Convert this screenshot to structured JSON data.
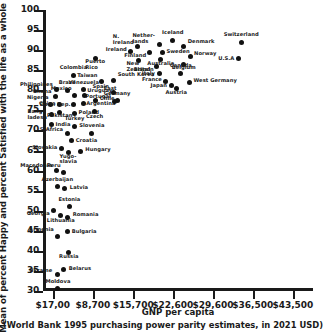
{
  "chart_data": {
    "type": "scatter",
    "title": "",
    "xlabel": "GNP per capita",
    "xlabel_note": "(World Bank 1995 purchasing power parity estimates, in 2021 USD)",
    "ylabel": "Mean of percent Happy and percent Satisfied with the life as a whole",
    "xlim": [
      0,
      47000
    ],
    "ylim": [
      30,
      100
    ],
    "grid": false,
    "legend": "none",
    "xticks": [
      {
        "value": 1700,
        "label": "$17,00"
      },
      {
        "value": 8700,
        "label": "$8,700"
      },
      {
        "value": 15700,
        "label": "$15,700"
      },
      {
        "value": 22600,
        "label": "$22,600"
      },
      {
        "value": 29600,
        "label": "$29,600"
      },
      {
        "value": 36500,
        "label": "$36,500"
      },
      {
        "value": 43500,
        "label": "$43,500"
      }
    ],
    "yticks": [
      {
        "value": 30,
        "label": "30"
      },
      {
        "value": 35,
        "label": "35"
      },
      {
        "value": 40,
        "label": "40"
      },
      {
        "value": 45,
        "label": "45"
      },
      {
        "value": 50,
        "label": "50"
      },
      {
        "value": 55,
        "label": "55"
      },
      {
        "value": 60,
        "label": "60"
      },
      {
        "value": 65,
        "label": "65"
      },
      {
        "value": 70,
        "label": "70"
      },
      {
        "value": 75,
        "label": "75"
      },
      {
        "value": 80,
        "label": "80"
      },
      {
        "value": 85,
        "label": "85"
      },
      {
        "value": 90,
        "label": "90"
      },
      {
        "value": 95,
        "label": "95"
      },
      {
        "value": 100,
        "label": "100"
      }
    ],
    "points": [
      {
        "label": "Moldova",
        "x": 2600,
        "y": 30.6,
        "lx": 0,
        "ly": -7,
        "align": "c"
      },
      {
        "label": "Ukraine",
        "x": 2500,
        "y": 34.0,
        "lx": -5,
        "ly": -4,
        "align": "r"
      },
      {
        "label": "Belarus",
        "x": 3600,
        "y": 35.3,
        "lx": 5,
        "ly": -1,
        "align": "l"
      },
      {
        "label": "Russia",
        "x": 4500,
        "y": 39.7,
        "lx": 0,
        "ly": 5,
        "align": "c"
      },
      {
        "label": "Armenia",
        "x": 2600,
        "y": 43.6,
        "lx": -4,
        "ly": -6,
        "align": "r"
      },
      {
        "label": "Bulgaria",
        "x": 4300,
        "y": 44.7,
        "lx": 4,
        "ly": 0,
        "align": "l"
      },
      {
        "label": "Georgia",
        "x": 1900,
        "y": 50.0,
        "lx": -4,
        "ly": 3,
        "align": "r"
      },
      {
        "label": "Lithuania",
        "x": 3100,
        "y": 48.7,
        "lx": 0,
        "ly": 5,
        "align": "c"
      },
      {
        "label": "Romania",
        "x": 4300,
        "y": 48.4,
        "lx": 5,
        "ly": -2,
        "align": "l"
      },
      {
        "label": "Estonia",
        "x": 4600,
        "y": 51.0,
        "lx": 0,
        "ly": -7,
        "align": "c"
      },
      {
        "label": "Azerbaijan",
        "x": 2500,
        "y": 56.0,
        "lx": 0,
        "ly": -7,
        "align": "c"
      },
      {
        "label": "Latvia",
        "x": 3800,
        "y": 55.5,
        "lx": 5,
        "ly": -1,
        "align": "l"
      },
      {
        "label": "Macedonia",
        "x": 2300,
        "y": 60.0,
        "lx": -4,
        "ly": -5,
        "align": "r"
      },
      {
        "label": "Peru",
        "x": 3600,
        "y": 59.6,
        "lx": -3,
        "ly": -6,
        "align": "r"
      },
      {
        "label": "Slovakia",
        "x": 3200,
        "y": 65.6,
        "lx": -4,
        "ly": 0,
        "align": "r"
      },
      {
        "label": "Yugo-\nslavia",
        "x": 4400,
        "y": 64.5,
        "lx": 0,
        "ly": 4,
        "align": "c"
      },
      {
        "label": "Hungary",
        "x": 6500,
        "y": 64.8,
        "lx": 5,
        "ly": -1,
        "align": "l"
      },
      {
        "label": "Croatia",
        "x": 5000,
        "y": 67.5,
        "lx": 4,
        "ly": 1,
        "align": "l"
      },
      {
        "label": "S-Africa",
        "x": 4200,
        "y": 69.2,
        "lx": -4,
        "ly": -4,
        "align": "r"
      },
      {
        "label": "Slovenia",
        "x": 8500,
        "y": 69.3,
        "lx": 0,
        "ly": -7,
        "align": "c"
      },
      {
        "label": "Turkey",
        "x": 5500,
        "y": 71.0,
        "lx": 0,
        "ly": -7,
        "align": "c"
      },
      {
        "label": "India",
        "x": 1500,
        "y": 71.6,
        "lx": 4,
        "ly": 1,
        "align": "l"
      },
      {
        "label": "Bang-\nladesh",
        "x": 1400,
        "y": 74.0,
        "lx": -4,
        "ly": -2,
        "align": "r"
      },
      {
        "label": "Pakistan",
        "x": 2900,
        "y": 74.5,
        "lx": 0,
        "ly": 4,
        "align": "c"
      },
      {
        "label": "Poland",
        "x": 5500,
        "y": 74.3,
        "lx": 4,
        "ly": 0,
        "align": "l"
      },
      {
        "label": "Czech",
        "x": 9000,
        "y": 74.7,
        "lx": 0,
        "ly": 5,
        "align": "c"
      },
      {
        "label": "Nigeria",
        "x": 1300,
        "y": 76.5,
        "lx": -2,
        "ly": -6,
        "align": "r"
      },
      {
        "label": "China",
        "x": 2900,
        "y": 76.4,
        "lx": -4,
        "ly": -1,
        "align": "r"
      },
      {
        "label": "Dom. Rep.",
        "x": 5300,
        "y": 76.5,
        "lx": -3,
        "ly": 1,
        "align": "r"
      },
      {
        "label": "Argentina",
        "x": 7000,
        "y": 76.8,
        "lx": 3,
        "ly": 1,
        "align": "l"
      },
      {
        "label": "Chile",
        "x": 9200,
        "y": 77.5,
        "lx": 4,
        "ly": -1,
        "align": "l"
      },
      {
        "label": "Portugal",
        "x": 12500,
        "y": 77.2,
        "lx": -4,
        "ly": -5,
        "align": "r"
      },
      {
        "label": "Ghana",
        "x": 2200,
        "y": 78.5,
        "lx": -4,
        "ly": -4,
        "align": "r"
      },
      {
        "label": "Mexico",
        "x": 5500,
        "y": 78.8,
        "lx": -3,
        "ly": -6,
        "align": "r"
      },
      {
        "label": "Uruguay",
        "x": 7200,
        "y": 78.7,
        "lx": 3,
        "ly": -5,
        "align": "l"
      },
      {
        "label": "East\nGermany",
        "x": 12900,
        "y": 77.4,
        "lx": 0,
        "ly": -12,
        "align": "c"
      },
      {
        "label": "Philippines",
        "x": 2400,
        "y": 80.2,
        "lx": -4,
        "ly": -4,
        "align": "r"
      },
      {
        "label": "Brazil",
        "x": 4200,
        "y": 80.0,
        "lx": 0,
        "ly": -7,
        "align": "c"
      },
      {
        "label": "Venezuela",
        "x": 7100,
        "y": 80.1,
        "lx": 0,
        "ly": -7,
        "align": "c"
      },
      {
        "label": "Spain",
        "x": 12200,
        "y": 79.5,
        "lx": -4,
        "ly": -5,
        "align": "r"
      },
      {
        "label": "Colombia",
        "x": 5300,
        "y": 83.8,
        "lx": 0,
        "ly": -7,
        "align": "c"
      },
      {
        "label": "Taiwan",
        "x": 10200,
        "y": 82.2,
        "lx": -4,
        "ly": -5,
        "align": "r"
      },
      {
        "label": "South Korea",
        "x": 12300,
        "y": 82.5,
        "lx": 4,
        "ly": -5,
        "align": "l"
      },
      {
        "label": "Puerto\nRico",
        "x": 9100,
        "y": 88.0,
        "lx": 0,
        "ly": 4,
        "align": "c"
      },
      {
        "label": "N.\nIreland",
        "x": 16500,
        "y": 91.0,
        "lx": -4,
        "ly": -9,
        "align": "r"
      },
      {
        "label": "Ireland",
        "x": 15300,
        "y": 89.6,
        "lx": -4,
        "ly": -2,
        "align": "r"
      },
      {
        "label": "Finland",
        "x": 18500,
        "y": 89.3,
        "lx": -3,
        "ly": 3,
        "align": "r"
      },
      {
        "label": "New\nZealand",
        "x": 16600,
        "y": 87.5,
        "lx": 0,
        "ly": 4,
        "align": "c"
      },
      {
        "label": "Nether-\nlands",
        "x": 20200,
        "y": 91.3,
        "lx": -4,
        "ly": -9,
        "align": "r"
      },
      {
        "label": "Sweden",
        "x": 20800,
        "y": 89.4,
        "lx": 4,
        "ly": -1,
        "align": "l"
      },
      {
        "label": "Australia",
        "x": 20500,
        "y": 87.6,
        "lx": 0,
        "ly": 4,
        "align": "c"
      },
      {
        "label": "Britain",
        "x": 19800,
        "y": 86.0,
        "lx": -3,
        "ly": 4,
        "align": "r"
      },
      {
        "label": "Italy",
        "x": 20200,
        "y": 84.1,
        "lx": -4,
        "ly": 0,
        "align": "r"
      },
      {
        "label": "France",
        "x": 21400,
        "y": 82.2,
        "lx": -4,
        "ly": -1,
        "align": "r"
      },
      {
        "label": "Japan",
        "x": 22300,
        "y": 81.2,
        "lx": -4,
        "ly": 1,
        "align": "r"
      },
      {
        "label": "Austria",
        "x": 23200,
        "y": 80.4,
        "lx": 0,
        "ly": 4,
        "align": "c"
      },
      {
        "label": "Iceland",
        "x": 22600,
        "y": 92.5,
        "lx": 0,
        "ly": -7,
        "align": "c"
      },
      {
        "label": "Denmark",
        "x": 24500,
        "y": 91.0,
        "lx": 4,
        "ly": -4,
        "align": "l"
      },
      {
        "label": "Norway",
        "x": 25600,
        "y": 88.5,
        "lx": 4,
        "ly": -2,
        "align": "l"
      },
      {
        "label": "Belgium",
        "x": 24500,
        "y": 86.5,
        "lx": 0,
        "ly": 4,
        "align": "c"
      },
      {
        "label": "Canada",
        "x": 24000,
        "y": 84.2,
        "lx": 0,
        "ly": -7,
        "align": "c"
      },
      {
        "label": "West Germany",
        "x": 25500,
        "y": 82.0,
        "lx": 4,
        "ly": -1,
        "align": "l"
      },
      {
        "label": "Switzerland",
        "x": 34500,
        "y": 92.0,
        "lx": 0,
        "ly": -7,
        "align": "c"
      },
      {
        "label": "U.S.A",
        "x": 34000,
        "y": 87.8,
        "lx": -4,
        "ly": 0,
        "align": "r"
      }
    ]
  }
}
